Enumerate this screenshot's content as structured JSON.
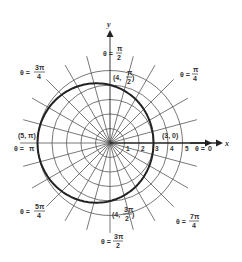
{
  "diagram": {
    "type": "polar-graph",
    "equation_shape": "limacon",
    "center_px": [
      110,
      143
    ],
    "unit_px": 14.5,
    "grid": {
      "circle_radii": [
        1,
        2,
        3,
        4,
        5
      ],
      "radial_line_step_deg": 15,
      "radial_line_length": 6.2
    },
    "axes": {
      "x_label": "x",
      "y_label": "y",
      "x_ticks": [
        "1",
        "2",
        "3",
        "4",
        "5"
      ]
    },
    "curve_points_labeled": [
      {
        "label": "(3, 0)",
        "r": 3,
        "theta": "0"
      },
      {
        "label_prefix": "(4, ",
        "frac_num": "π",
        "frac_den": "2",
        "r": 4,
        "theta": "π/2"
      },
      {
        "label": "(5, π)",
        "r": 5,
        "theta": "π"
      },
      {
        "label_prefix": "(4, ",
        "frac_num": "3π",
        "frac_den": "2",
        "r": 4,
        "theta": "3π/2"
      }
    ],
    "angle_labels": [
      {
        "prefix": "θ = ",
        "value": "0"
      },
      {
        "prefix": "θ = ",
        "num": "π",
        "den": "4"
      },
      {
        "prefix": "θ = ",
        "num": "π",
        "den": "2"
      },
      {
        "prefix": "θ = ",
        "num": "3π",
        "den": "4"
      },
      {
        "prefix": "θ = ",
        "value": "π"
      },
      {
        "prefix": "θ = ",
        "num": "5π",
        "den": "4"
      },
      {
        "prefix": "θ = ",
        "num": "3π",
        "den": "2"
      },
      {
        "prefix": "θ = ",
        "num": "7π",
        "den": "4"
      }
    ]
  }
}
